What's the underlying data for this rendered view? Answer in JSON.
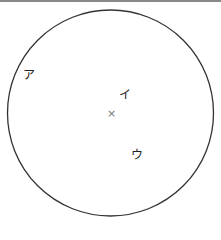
{
  "diagram": {
    "type": "circle-with-points",
    "center_mark": "×",
    "labels": [
      {
        "id": "a",
        "text": "ア"
      },
      {
        "id": "i",
        "text": "イ"
      },
      {
        "id": "u",
        "text": "ウ"
      }
    ]
  }
}
